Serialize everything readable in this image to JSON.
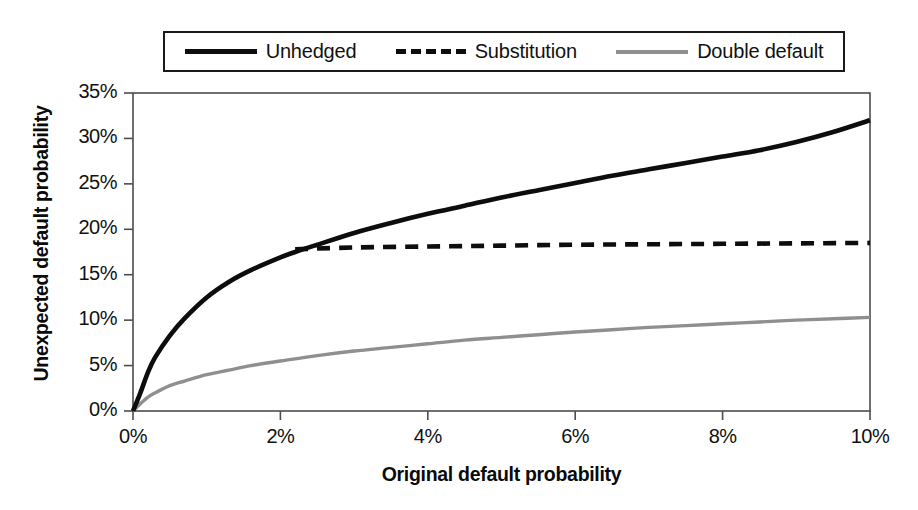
{
  "chart_data": {
    "type": "line",
    "title": "",
    "xlabel": "Original default probability",
    "ylabel": "Unexpected default probability",
    "xlim": [
      0,
      10
    ],
    "ylim": [
      0,
      35
    ],
    "grid": false,
    "legend_position": "top",
    "x_ticks": [
      "0%",
      "2%",
      "4%",
      "6%",
      "8%",
      "10%"
    ],
    "x_tick_values": [
      0,
      2,
      4,
      6,
      8,
      10
    ],
    "y_ticks": [
      "0%",
      "5%",
      "10%",
      "15%",
      "20%",
      "25%",
      "30%",
      "35%"
    ],
    "y_tick_values": [
      0,
      5,
      10,
      15,
      20,
      25,
      30,
      35
    ],
    "series": [
      {
        "name": "Unhedged",
        "style": "solid",
        "color": "#0d0d0d",
        "x": [
          0,
          0.1,
          0.2,
          0.3,
          0.5,
          0.7,
          1.0,
          1.3,
          1.6,
          2.0,
          2.2,
          2.5,
          3.0,
          3.5,
          4.0,
          4.5,
          5.0,
          5.5,
          6.0,
          6.5,
          7.0,
          7.5,
          8.0,
          8.5,
          9.0,
          9.5,
          10.0
        ],
        "values": [
          0,
          2.0,
          4.2,
          5.9,
          8.3,
          10.2,
          12.5,
          14.2,
          15.5,
          16.9,
          17.5,
          18.3,
          19.6,
          20.7,
          21.7,
          22.6,
          23.5,
          24.3,
          25.1,
          25.9,
          26.6,
          27.3,
          28.0,
          28.7,
          29.6,
          30.7,
          32.0
        ]
      },
      {
        "name": "Substitution",
        "style": "dashed",
        "color": "#0d0d0d",
        "x": [
          2.2,
          3.0,
          4.0,
          5.0,
          6.0,
          7.0,
          8.0,
          9.0,
          10.0
        ],
        "values": [
          17.8,
          18.0,
          18.1,
          18.2,
          18.3,
          18.35,
          18.4,
          18.45,
          18.5
        ]
      },
      {
        "name": "Double default",
        "style": "solid",
        "color": "#8f8f8f",
        "x": [
          0,
          0.1,
          0.2,
          0.3,
          0.5,
          0.7,
          1.0,
          1.3,
          1.6,
          2.0,
          2.5,
          3.0,
          3.5,
          4.0,
          4.5,
          5.0,
          5.5,
          6.0,
          6.5,
          7.0,
          7.5,
          8.0,
          8.5,
          9.0,
          9.5,
          10.0
        ],
        "values": [
          0,
          0.8,
          1.5,
          2.0,
          2.8,
          3.3,
          4.0,
          4.5,
          5.0,
          5.5,
          6.1,
          6.6,
          7.0,
          7.4,
          7.8,
          8.1,
          8.4,
          8.7,
          8.95,
          9.2,
          9.4,
          9.6,
          9.8,
          10.0,
          10.15,
          10.3
        ]
      }
    ]
  },
  "legend": {
    "entries": [
      {
        "label": "Unhedged"
      },
      {
        "label": "Substitution"
      },
      {
        "label": "Double default"
      }
    ]
  },
  "axes": {
    "y_title": "Unexpected default probability",
    "x_title": "Original default probability"
  },
  "colors": {
    "unhedged": "#0d0d0d",
    "substitution": "#0d0d0d",
    "double_default": "#8f8f8f",
    "axis": "#4d4d4d",
    "background": "#ffffff"
  }
}
